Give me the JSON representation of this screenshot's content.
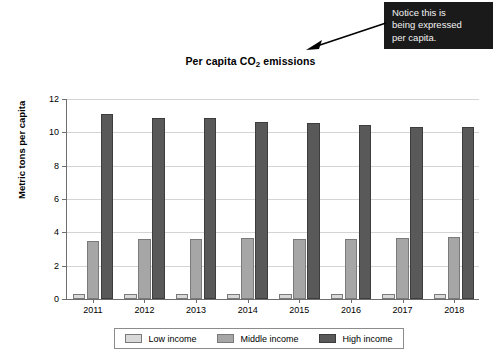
{
  "annotation": {
    "lines": [
      "Notice this is",
      "being expressed",
      "per capita."
    ],
    "box_color": "#1a1a1a",
    "text_color": "#f2f2f2",
    "arrow": "arrow-pointing-left-down-to-title"
  },
  "chart_data": {
    "type": "bar",
    "title_prefix": "Per capita CO",
    "title_sub": "2",
    "title_suffix": " emissions",
    "title": "Per capita CO2 emissions",
    "xlabel": "",
    "ylabel": "Metric tons per capita",
    "categories": [
      "2011",
      "2012",
      "2013",
      "2014",
      "2015",
      "2016",
      "2017",
      "2018"
    ],
    "series": [
      {
        "name": "Low income",
        "color": "#d9d9d9",
        "values": [
          0.32,
          0.3,
          0.3,
          0.31,
          0.29,
          0.29,
          0.28,
          0.29
        ]
      },
      {
        "name": "Middle income",
        "color": "#a6a6a6",
        "values": [
          3.5,
          3.58,
          3.63,
          3.64,
          3.6,
          3.6,
          3.67,
          3.75
        ]
      },
      {
        "name": "High income",
        "color": "#595959",
        "values": [
          11.1,
          10.85,
          10.85,
          10.65,
          10.55,
          10.45,
          10.35,
          10.3
        ]
      }
    ],
    "ylim": [
      0,
      12
    ],
    "yticks": [
      0,
      2,
      4,
      6,
      8,
      10,
      12
    ],
    "grid": true,
    "legend_position": "bottom"
  }
}
